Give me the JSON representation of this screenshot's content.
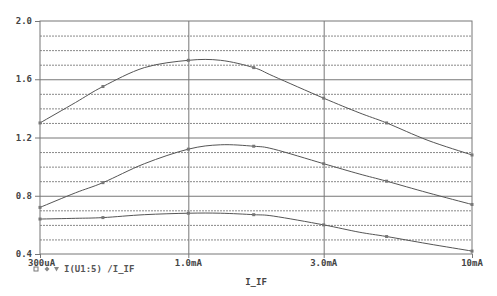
{
  "chart_data": {
    "type": "line",
    "title": "",
    "xlabel": "I_IF",
    "ylabel": "",
    "x_scale": "log",
    "xlim": [
      0.0003,
      0.01
    ],
    "ylim": [
      0.4,
      2.0
    ],
    "x_ticks": [
      {
        "value": 0.0003,
        "label": "300uA"
      },
      {
        "value": 0.001,
        "label": "1.0mA"
      },
      {
        "value": 0.003,
        "label": "3.0mA"
      },
      {
        "value": 0.01,
        "label": "10mA"
      }
    ],
    "y_ticks": [
      {
        "value": 0.4,
        "label": "0.4"
      },
      {
        "value": 0.8,
        "label": "0.8"
      },
      {
        "value": 1.2,
        "label": "1.2"
      },
      {
        "value": 1.6,
        "label": "1.6"
      },
      {
        "value": 2.0,
        "label": "2.0"
      }
    ],
    "grid": {
      "major_y": [
        0.8,
        1.2,
        1.6
      ],
      "minor_y_step": 0.1,
      "major_x": [
        0.001,
        0.003
      ]
    },
    "legend": {
      "position": "bottom-left",
      "markers": [
        "square",
        "diamond",
        "triangle-down"
      ],
      "text": "I(U1:5) /I_IF"
    },
    "x": [
      0.0003,
      0.0004,
      0.0005,
      0.0007,
      0.001,
      0.0013,
      0.0017,
      0.002,
      0.003,
      0.004,
      0.005,
      0.007,
      0.01
    ],
    "series": [
      {
        "name": "I(U1:5)/I_IF (upper)",
        "marker": "square",
        "values": [
          1.3,
          1.44,
          1.55,
          1.68,
          1.73,
          1.73,
          1.68,
          1.62,
          1.47,
          1.37,
          1.3,
          1.18,
          1.08
        ]
      },
      {
        "name": "I(U1:5)/I_IF (middle)",
        "marker": "diamond",
        "values": [
          0.72,
          0.82,
          0.89,
          1.02,
          1.12,
          1.15,
          1.14,
          1.12,
          1.02,
          0.95,
          0.9,
          0.82,
          0.74
        ]
      },
      {
        "name": "I(U1:5)/I_IF (lower)",
        "marker": "triangle-down",
        "values": [
          0.64,
          0.645,
          0.65,
          0.67,
          0.68,
          0.68,
          0.67,
          0.66,
          0.6,
          0.55,
          0.52,
          0.47,
          0.42
        ]
      }
    ],
    "colors": {
      "line": "#555555",
      "grid_major": "#777777",
      "grid_minor": "#888888",
      "frame": "#777777",
      "text": "#444444"
    }
  }
}
